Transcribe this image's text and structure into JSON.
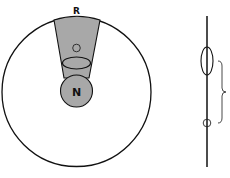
{
  "diagram": {
    "labels": {
      "top": "R",
      "center": "N"
    },
    "colors": {
      "stroke": "#111111",
      "fill": "#a8a8a8",
      "background": "#ffffff"
    }
  }
}
